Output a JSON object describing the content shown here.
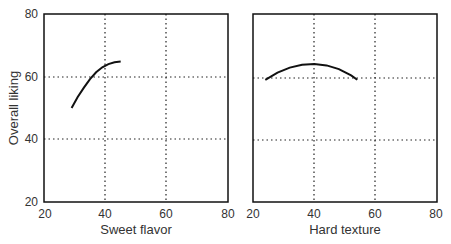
{
  "chart_data": [
    {
      "type": "line",
      "title": "",
      "xlabel": "Sweet flavor",
      "ylabel": "Overall liking",
      "xlim": [
        20,
        80
      ],
      "ylim": [
        20,
        80
      ],
      "xticks": [
        "20",
        "40",
        "60",
        "80"
      ],
      "yticks": [
        "20",
        "40",
        "60",
        "80"
      ],
      "grid": "dotted at 40 and 60",
      "series": [
        {
          "name": "Sweet flavor response",
          "x": [
            29,
            31,
            33,
            35,
            37,
            39,
            41,
            43,
            45
          ],
          "y": [
            50,
            53.5,
            56.5,
            59.2,
            61.4,
            63.0,
            64.0,
            64.6,
            64.8
          ]
        }
      ]
    },
    {
      "type": "line",
      "title": "",
      "xlabel": "Hard texture",
      "ylabel": "",
      "xlim": [
        20,
        80
      ],
      "ylim": [
        20,
        80
      ],
      "xticks": [
        "20",
        "40",
        "60",
        "80"
      ],
      "yticks": [],
      "grid": "dotted at 40 and 60",
      "series": [
        {
          "name": "Hard texture response",
          "x": [
            24,
            28,
            32,
            36,
            40,
            44,
            48,
            52,
            54
          ],
          "y": [
            59,
            61.3,
            62.9,
            63.8,
            64.0,
            63.6,
            62.4,
            60.4,
            59
          ]
        }
      ]
    }
  ],
  "labels": {
    "left_xlabel": "Sweet flavor",
    "right_xlabel": "Hard texture",
    "ylabel": "Overall liking",
    "tick_20": "20",
    "tick_40": "40",
    "tick_60": "60",
    "tick_80": "80"
  }
}
